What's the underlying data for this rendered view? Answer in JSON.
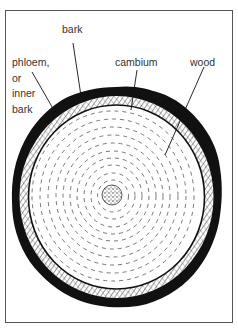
{
  "diagram": {
    "labels": {
      "bark": "bark",
      "phloem": [
        "phloem,",
        "or",
        "inner",
        "bark"
      ],
      "cambium": "cambium",
      "wood": "wood"
    },
    "colors": {
      "ink": "#111111",
      "text": "#333333",
      "frame": "#555555",
      "background": "#ffffff"
    }
  }
}
